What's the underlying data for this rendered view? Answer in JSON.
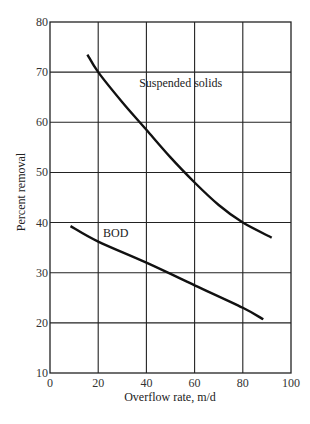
{
  "chart_data": {
    "type": "line",
    "title": "",
    "xlabel": "Overflow rate, m/d",
    "ylabel": "Percent removal",
    "xlim": [
      0,
      100
    ],
    "ylim": [
      10,
      80
    ],
    "xticks": [
      0,
      20,
      40,
      60,
      80,
      100
    ],
    "yticks": [
      10,
      20,
      30,
      40,
      50,
      60,
      70,
      80
    ],
    "grid": true,
    "legend": "none (curves labeled directly)",
    "series": [
      {
        "name": "Suspended solids",
        "label_position": {
          "x": 37,
          "y": 67
        },
        "points": [
          [
            15.5,
            73.5
          ],
          [
            20,
            70
          ],
          [
            30,
            64
          ],
          [
            40,
            58.5
          ],
          [
            50,
            53
          ],
          [
            60,
            48
          ],
          [
            70,
            43.5
          ],
          [
            80,
            40
          ],
          [
            92,
            37
          ]
        ]
      },
      {
        "name": "BOD",
        "label_position": {
          "x": 22,
          "y": 37.2
        },
        "points": [
          [
            8.5,
            39.3
          ],
          [
            20,
            36.2
          ],
          [
            40,
            32
          ],
          [
            60,
            27.5
          ],
          [
            80,
            23
          ],
          [
            88.5,
            20.7
          ]
        ]
      }
    ]
  },
  "colors": {
    "background": "#ffffff",
    "line": "#111111",
    "grid": "#222222",
    "text": "#222222"
  }
}
